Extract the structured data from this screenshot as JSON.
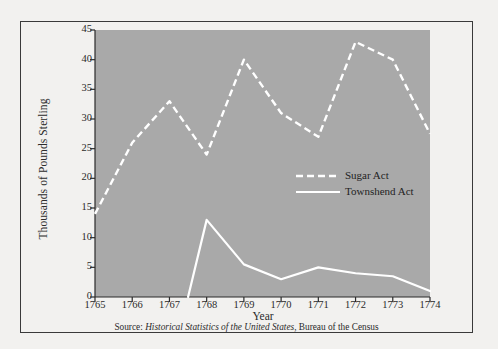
{
  "figure": {
    "background_color": "#f2f1ef",
    "plot_background_color": "#a9a9a9",
    "line_color": "#ffffff",
    "text_color": "#2b2b2b",
    "border_color": "#3a3a3a"
  },
  "axis": {
    "y_title": "Thousands of Pounds Sterling",
    "x_title": "Year",
    "y_ticks": [
      "0",
      "5",
      "10",
      "15",
      "20",
      "25",
      "30",
      "35",
      "40",
      "45"
    ],
    "x_ticks": [
      "1765",
      "1766",
      "1767",
      "1768",
      "1769",
      "1770",
      "1771",
      "1772",
      "1773",
      "1774"
    ]
  },
  "legend": {
    "entries": [
      {
        "label": "Sugar Act",
        "style": "dashed"
      },
      {
        "label": "Townshend Act",
        "style": "solid"
      }
    ]
  },
  "source": {
    "prefix": "Source: ",
    "italic": "Historical Statistics of the United States",
    "suffix": ", Bureau of the Census"
  },
  "chart_data": {
    "type": "line",
    "title": "",
    "xlabel": "Year",
    "ylabel": "Thousands of Pounds Sterling",
    "x": [
      1765,
      1766,
      1767,
      1768,
      1769,
      1770,
      1771,
      1772,
      1773,
      1774
    ],
    "xlim": [
      1765,
      1774
    ],
    "ylim": [
      0,
      45
    ],
    "ytick_step": 5,
    "grid": false,
    "legend_position": "center-right",
    "series": [
      {
        "name": "Sugar Act",
        "style": "dashed",
        "color": "#ffffff",
        "x": [
          1765,
          1766,
          1767,
          1768,
          1769,
          1770,
          1771,
          1772,
          1773,
          1774
        ],
        "values": [
          14,
          26,
          33,
          24,
          40,
          31,
          27,
          43,
          40,
          27.5
        ]
      },
      {
        "name": "Townshend Act",
        "style": "solid",
        "color": "#ffffff",
        "x": [
          1767.5,
          1768,
          1769,
          1770,
          1771,
          1772,
          1773,
          1774
        ],
        "values": [
          0,
          13,
          5.5,
          3,
          5,
          4,
          3.5,
          1
        ]
      }
    ]
  }
}
